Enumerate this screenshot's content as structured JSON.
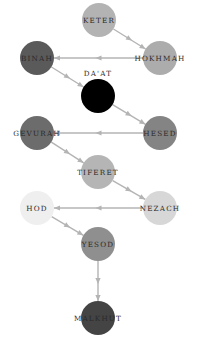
{
  "diagram": {
    "type": "directed-graph",
    "nodes": [
      {
        "id": "keter",
        "label": "KETER",
        "x": 99,
        "y": 20,
        "r": 17,
        "color": "#b3b3b3",
        "label_dy": 0
      },
      {
        "id": "hokhmah",
        "label": "HOKHMAH",
        "x": 160,
        "y": 58,
        "r": 17,
        "color": "#acacac",
        "label_dy": 0
      },
      {
        "id": "binah",
        "label": "BINAH",
        "x": 37,
        "y": 58,
        "r": 17,
        "color": "#5a5a5a",
        "label_dy": 0
      },
      {
        "id": "daat",
        "label": "DA'AT",
        "x": 98,
        "y": 96,
        "r": 17,
        "color": "#000000",
        "label_dy": -23
      },
      {
        "id": "hesed",
        "label": "HESED",
        "x": 160,
        "y": 133,
        "r": 17,
        "color": "#848484",
        "label_dy": 0
      },
      {
        "id": "gevurah",
        "label": "GEVURAH",
        "x": 37,
        "y": 133,
        "r": 17,
        "color": "#6c6c6c",
        "label_dy": 0
      },
      {
        "id": "tiferet",
        "label": "TIFERET",
        "x": 98,
        "y": 172,
        "r": 17,
        "color": "#b5b5b5",
        "label_dy": 0
      },
      {
        "id": "nezach",
        "label": "NEZACH",
        "x": 160,
        "y": 208,
        "r": 17,
        "color": "#d7d7d7",
        "label_dy": 0
      },
      {
        "id": "hod",
        "label": "HOD",
        "x": 37,
        "y": 208,
        "r": 17,
        "color": "#efefef",
        "label_dy": 0
      },
      {
        "id": "yesod",
        "label": "YESOD",
        "x": 98,
        "y": 244,
        "r": 17,
        "color": "#8f8f8f",
        "label_dy": 0
      },
      {
        "id": "malkhut",
        "label": "MALKHUT",
        "x": 98,
        "y": 318,
        "r": 17,
        "color": "#444444",
        "label_dy": 0
      }
    ],
    "edges": [
      {
        "from": "keter",
        "to": "hokhmah"
      },
      {
        "from": "hokhmah",
        "to": "binah"
      },
      {
        "from": "binah",
        "to": "daat"
      },
      {
        "from": "daat",
        "to": "hesed"
      },
      {
        "from": "hesed",
        "to": "gevurah"
      },
      {
        "from": "gevurah",
        "to": "tiferet"
      },
      {
        "from": "tiferet",
        "to": "nezach"
      },
      {
        "from": "nezach",
        "to": "hod"
      },
      {
        "from": "hod",
        "to": "yesod"
      },
      {
        "from": "yesod",
        "to": "malkhut"
      }
    ],
    "edge_color": "#b4b4b4"
  }
}
